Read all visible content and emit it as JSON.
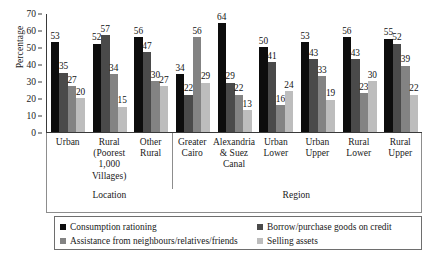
{
  "chart_data": {
    "type": "bar",
    "title": "",
    "xlabel": "",
    "ylabel": "Percentage",
    "ylim": [
      0,
      70
    ],
    "yticks": [
      0,
      10,
      20,
      30,
      40,
      50,
      60,
      70
    ],
    "grid": false,
    "legend_position": "bottom",
    "categories": [
      "Urban",
      "Rural (Poorest 1,000 Villages)",
      "Other Rural",
      "Greater Cairo",
      "Alexandria & Suez Canal",
      "Urban Lower",
      "Urban Upper",
      "Rural Lower",
      "Rural Upper"
    ],
    "category_lines": [
      [
        "Urban"
      ],
      [
        "Rural",
        "(Poorest",
        "1,000",
        "Villages)"
      ],
      [
        "Other",
        "Rural"
      ],
      [
        "Greater",
        "Cairo"
      ],
      [
        "Alexandria",
        "& Suez",
        "Canal"
      ],
      [
        "Urban",
        "Lower"
      ],
      [
        "Urban",
        "Upper"
      ],
      [
        "Rural",
        "Lower"
      ],
      [
        "Rural",
        "Upper"
      ]
    ],
    "category_groups": [
      {
        "label": "Location",
        "span": 3
      },
      {
        "label": "Region",
        "span": 6
      }
    ],
    "series": [
      {
        "name": "Consumption rationing",
        "color": "#0d0d0d",
        "values": [
          53,
          52,
          56,
          34,
          64,
          50,
          53,
          56,
          55
        ]
      },
      {
        "name": "Borrow/purchase goods on credit",
        "color": "#4a4a4a",
        "values": [
          35,
          57,
          47,
          22,
          29,
          41,
          43,
          43,
          52
        ]
      },
      {
        "name": "Assistance from neighbours/relatives/friends",
        "color": "#838383",
        "values": [
          27,
          34,
          30,
          56,
          22,
          16,
          33,
          23,
          39
        ]
      },
      {
        "name": "Selling assets",
        "color": "#bdbdbd",
        "values": [
          20,
          15,
          27,
          29,
          13,
          24,
          19,
          30,
          22
        ]
      }
    ]
  },
  "axis": {
    "y_title": "Percentage"
  }
}
